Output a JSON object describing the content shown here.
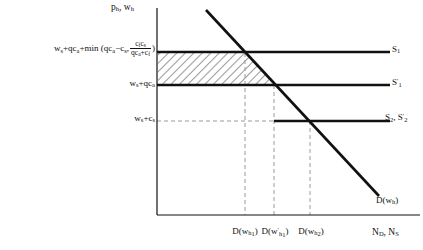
{
  "figure": {
    "type": "economics-supply-demand-diagram",
    "background_color": "#ffffff",
    "line_color": "#111111",
    "dash_color": "#999999",
    "hatch_color": "#333333"
  },
  "axes": {
    "y_title": "p_h, w_h",
    "y_title_parts": {
      "a": "p",
      "a_sub": "h",
      "sep": ", ",
      "b": "w",
      "b_sub": "h"
    },
    "x_title": "N_D, N_S",
    "x_title_parts": {
      "a": "N",
      "a_sub": "D",
      "sep": ", ",
      "b": "N",
      "b_sub": "S"
    },
    "origin_px": {
      "x": 157,
      "y": 215
    },
    "x_axis_end_px": 420,
    "y_axis_top_px": 8
  },
  "y_ticks": [
    {
      "id": "p-high",
      "text": "w_s+qc_a+min(qc_a-c_s, c_f c_s/(qc_a+c_f))",
      "parts": {
        "lead": "w",
        "lead_sub": "s",
        "t1": "+qc",
        "t1_sub": "a",
        "t2": "+min (qc",
        "t2_sub": "a",
        "t3": "−c",
        "t3_sub": "s",
        "t4": ",",
        "frac_num_a": "c",
        "frac_num_a_sub": "f",
        "frac_num_b": "c",
        "frac_num_b_sub": "s",
        "frac_den_a": "qc",
        "frac_den_a_sub": "a",
        "frac_den_b": "+c",
        "frac_den_b_sub": "f",
        "tail": ")"
      },
      "y_px": 52
    },
    {
      "id": "p-mid",
      "text": "w_s+qc_a",
      "parts": {
        "lead": "w",
        "lead_sub": "s",
        "t1": "+qc",
        "t1_sub": "a"
      },
      "y_px": 85
    },
    {
      "id": "p-low",
      "text": "w_s+c_s",
      "parts": {
        "lead": "w",
        "lead_sub": "s",
        "t1": "+c",
        "t1_sub": "s"
      },
      "y_px": 121
    }
  ],
  "x_ticks": [
    {
      "id": "d-wh1",
      "text": "D(w_h1)",
      "parts": {
        "lead": "D(w",
        "sub": "h",
        "subsub": "1",
        "tail": ")"
      },
      "x_px": 245
    },
    {
      "id": "d-wh1p",
      "text": "D(w'_h1)",
      "parts": {
        "lead": "D(w",
        "prime": "′",
        "sub": "h",
        "subsub": "1",
        "tail": ")"
      },
      "x_px": 274
    },
    {
      "id": "d-wh2",
      "text": "D(w_h2)",
      "parts": {
        "lead": "D(w",
        "sub": "h",
        "subsub": "2",
        "tail": ")"
      },
      "x_px": 310
    }
  ],
  "curves": {
    "supply_1": {
      "label": "S_1",
      "label_parts": {
        "lead": "S",
        "sub": "1"
      },
      "y_px": 52,
      "x_start_px": 157,
      "x_end_px": 390,
      "style": "solid",
      "width_px": 2.4
    },
    "supply_1_prime": {
      "label": "S'_1",
      "label_parts": {
        "lead": "S",
        "prime": "′",
        "sub": "1"
      },
      "y_px": 85,
      "x_start_px": 157,
      "x_end_px": 390,
      "style": "solid",
      "width_px": 2.4
    },
    "supply_2": {
      "label": "S_2, S'_2",
      "label_parts": {
        "lead_a": "S",
        "sub_a": "2",
        "sep": ", ",
        "lead_b": "S",
        "prime_b": "′",
        "sub_b": "2"
      },
      "y_px": 121,
      "x_start_px": 274,
      "x_end_px": 390,
      "style": "solid",
      "width_px": 2.4
    },
    "demand": {
      "label": "D(w_h)",
      "label_parts": {
        "lead": "D(w",
        "sub": "h",
        "tail": ")"
      },
      "points_px": [
        {
          "x": 206,
          "y": 10
        },
        {
          "x": 379,
          "y": 196
        }
      ],
      "style": "solid",
      "width_px": 2.6
    }
  },
  "hatched_region": {
    "description": "surplus area between S1 and S1-prime bounded right by demand curve",
    "vertices_px": [
      {
        "x": 158,
        "y": 53
      },
      {
        "x": 245,
        "y": 53
      },
      {
        "x": 274,
        "y": 84
      },
      {
        "x": 158,
        "y": 84
      }
    ],
    "pattern": "diagonal-hatch",
    "angle_deg": 45,
    "spacing_px": 6
  },
  "dashed_guides": [
    {
      "id": "v-wh1",
      "orientation": "vertical",
      "x_px": 245,
      "y_from_px": 53,
      "y_to_px": 215
    },
    {
      "id": "v-wh1p",
      "orientation": "vertical",
      "x_px": 274,
      "y_from_px": 85,
      "y_to_px": 215
    },
    {
      "id": "v-wh2",
      "orientation": "vertical",
      "x_px": 310,
      "y_from_px": 121,
      "y_to_px": 215
    },
    {
      "id": "h-plow",
      "orientation": "horizontal",
      "y_px": 121,
      "x_from_px": 157,
      "x_to_px": 274
    }
  ]
}
